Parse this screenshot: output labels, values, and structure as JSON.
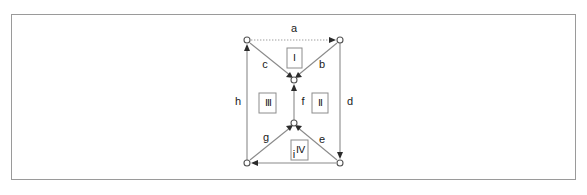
{
  "figure": {
    "frame_color": "#9a9a9a",
    "background_color": "#ffffff",
    "edge_color": "#8a8a8a",
    "arrow_color": "#2b2b2b",
    "node_stroke_color": "#555555",
    "label_color": "#1a1a1a"
  },
  "nodes": [
    {
      "id": "top-left",
      "label": "",
      "x": 247,
      "y": 40
    },
    {
      "id": "top-right",
      "label": "",
      "x": 340,
      "y": 40
    },
    {
      "id": "center-upper",
      "label": "",
      "x": 294,
      "y": 80
    },
    {
      "id": "center-lower",
      "label": "",
      "x": 294,
      "y": 123
    },
    {
      "id": "bottom-left",
      "label": "",
      "x": 247,
      "y": 163
    },
    {
      "id": "bottom-right",
      "label": "",
      "x": 340,
      "y": 163
    }
  ],
  "edges": [
    {
      "id": "a",
      "label": "a",
      "from": "top-left",
      "to": "top-right",
      "style": "dotted",
      "label_x": 294,
      "label_y": 29
    },
    {
      "id": "b",
      "label": "b",
      "from": "top-right",
      "to": "center-upper",
      "style": "solid",
      "label_x": 322,
      "label_y": 65
    },
    {
      "id": "c",
      "label": "c",
      "from": "top-left",
      "to": "center-upper",
      "style": "solid",
      "label_x": 265,
      "label_y": 65
    },
    {
      "id": "d",
      "label": "d",
      "from": "top-right",
      "to": "bottom-right",
      "style": "solid",
      "label_x": 350,
      "label_y": 102
    },
    {
      "id": "e",
      "label": "e",
      "from": "bottom-right",
      "to": "center-lower",
      "style": "solid",
      "label_x": 322,
      "label_y": 140
    },
    {
      "id": "f",
      "label": "f",
      "from": "center-lower",
      "to": "center-upper",
      "style": "solid",
      "label_x": 303,
      "label_y": 102
    },
    {
      "id": "g",
      "label": "g",
      "from": "bottom-left",
      "to": "center-lower",
      "style": "solid",
      "label_x": 266,
      "label_y": 138
    },
    {
      "id": "h",
      "label": "h",
      "from": "bottom-left",
      "to": "top-left",
      "style": "solid",
      "label_x": 238,
      "label_y": 102
    },
    {
      "id": "i",
      "label": "i",
      "from": "bottom-right",
      "to": "bottom-left",
      "style": "solid",
      "label_x": 294,
      "label_y": 155
    }
  ],
  "faces": [
    {
      "id": "face-1",
      "label": "Ⅰ",
      "x": 294,
      "y": 58
    },
    {
      "id": "face-2",
      "label": "Ⅱ",
      "x": 320,
      "y": 103
    },
    {
      "id": "face-3",
      "label": "Ⅲ",
      "x": 268,
      "y": 103
    },
    {
      "id": "face-4",
      "label": "Ⅳ",
      "x": 300,
      "y": 150
    }
  ]
}
